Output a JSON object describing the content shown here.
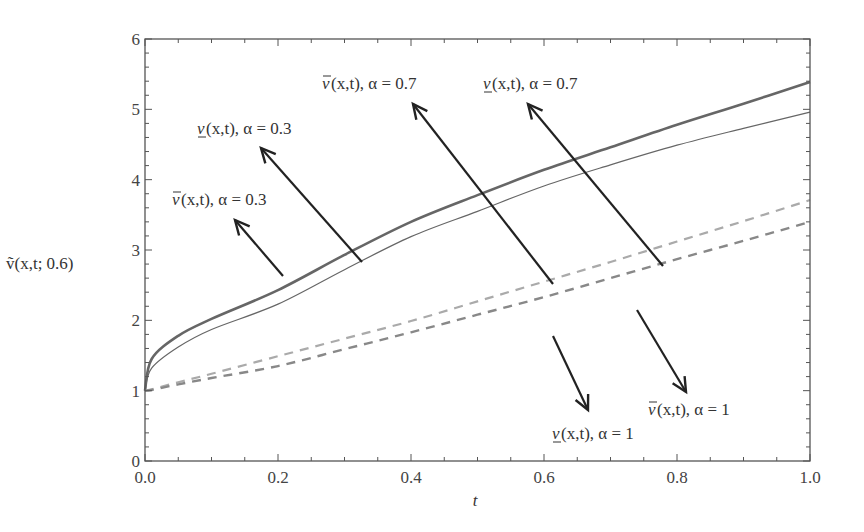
{
  "chart_data": {
    "type": "line",
    "title": "",
    "xlabel": "t",
    "ylabel": "ṽ(x,t; 0.6)",
    "xlim": [
      0.0,
      1.0
    ],
    "ylim": [
      0,
      6
    ],
    "grid": false,
    "legend": "none (curves identified by arrow annotations)",
    "x_ticks": [
      "0.0",
      "0.2",
      "0.4",
      "0.6",
      "0.8",
      "1.0"
    ],
    "y_ticks": [
      "0",
      "1",
      "2",
      "3",
      "4",
      "5",
      "6"
    ],
    "x": [
      0.0,
      0.01,
      0.05,
      0.1,
      0.2,
      0.3,
      0.4,
      0.5,
      0.6,
      0.7,
      0.8,
      0.9,
      1.0
    ],
    "series": [
      {
        "name": "v̄(x,t), α = 0.3",
        "style": "solid-thick",
        "color": "#666666",
        "values": [
          1.0,
          1.45,
          1.78,
          2.02,
          2.43,
          2.93,
          3.4,
          3.78,
          4.14,
          4.46,
          4.78,
          5.08,
          5.39
        ]
      },
      {
        "name": "v̲(x,t), α = 0.3",
        "style": "solid-thin",
        "color": "#666666",
        "values": [
          1.0,
          1.32,
          1.62,
          1.87,
          2.23,
          2.72,
          3.19,
          3.55,
          3.91,
          4.21,
          4.49,
          4.73,
          4.96
        ]
      },
      {
        "name": "v̄(x,t), α = 0.7",
        "style": "dashed-light",
        "color": "#aaaaaa",
        "values": [
          1.0,
          1.02,
          1.12,
          1.24,
          1.49,
          1.74,
          1.99,
          2.27,
          2.55,
          2.83,
          3.12,
          3.41,
          3.71
        ]
      },
      {
        "name": "v̲(x,t), α = 0.7",
        "style": "dashed-dark",
        "color": "#888888",
        "values": [
          1.0,
          1.01,
          1.09,
          1.18,
          1.35,
          1.59,
          1.83,
          2.08,
          2.33,
          2.6,
          2.87,
          3.13,
          3.4
        ]
      }
    ],
    "annotations": [
      {
        "text_main": "v",
        "bar": "over",
        "text_rest": "(x,t), α = 0.3",
        "label_x": 172,
        "label_y": 205,
        "arrow_from": [
          283,
          276
        ],
        "arrow_to": [
          235,
          220
        ]
      },
      {
        "text_main": "v",
        "bar": "under",
        "text_rest": "(x,t), α = 0.3",
        "label_x": 197,
        "label_y": 134,
        "arrow_from": [
          362,
          262
        ],
        "arrow_to": [
          261,
          148
        ]
      },
      {
        "text_main": "v",
        "bar": "over",
        "text_rest": "(x,t), α = 0.7",
        "label_x": 322,
        "label_y": 89,
        "arrow_from": [
          553,
          284
        ],
        "arrow_to": [
          413,
          104
        ]
      },
      {
        "text_main": "v",
        "bar": "under",
        "text_rest": "(x,t), α = 0.7",
        "label_x": 483,
        "label_y": 89,
        "arrow_from": [
          663,
          266
        ],
        "arrow_to": [
          528,
          104
        ]
      },
      {
        "text_main": "v",
        "bar": "under",
        "text_rest": "(x,t), α = 1",
        "label_x": 552,
        "label_y": 439,
        "arrow_from": [
          553,
          336
        ],
        "arrow_to": [
          588,
          410
        ]
      },
      {
        "text_main": "v",
        "bar": "over",
        "text_rest": "(x,t), α = 1",
        "label_x": 648,
        "label_y": 415,
        "arrow_from": [
          637,
          310
        ],
        "arrow_to": [
          686,
          392
        ]
      }
    ]
  },
  "layout": {
    "plot_left": 145,
    "plot_right": 810,
    "plot_top": 39,
    "plot_bottom": 461
  }
}
